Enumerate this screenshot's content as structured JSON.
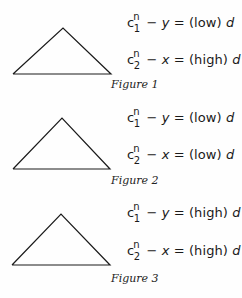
{
  "figures": [
    {
      "caption": "Figure 1",
      "eq1": {
        "c": "c",
        "sup": "n",
        "sub": "1",
        "minus": "−",
        "var": "y",
        "eq": "=",
        "level": "(low)",
        "d": "d"
      },
      "eq2": {
        "c": "c",
        "sup": "n",
        "sub": "2",
        "minus": "−",
        "var": "x",
        "eq": "=",
        "level": "(high)",
        "d": "d"
      }
    },
    {
      "caption": "Figure 2",
      "eq1": {
        "c": "c",
        "sup": "n",
        "sub": "1",
        "minus": "−",
        "var": "y",
        "eq": "=",
        "level": "(low)",
        "d": "d"
      },
      "eq2": {
        "c": "c",
        "sup": "n",
        "sub": "2",
        "minus": "−",
        "var": "x",
        "eq": "=",
        "level": "(low)",
        "d": "d"
      }
    },
    {
      "caption": "Figure 3",
      "eq1": {
        "c": "c",
        "sup": "n",
        "sub": "1",
        "minus": "−",
        "var": "y",
        "eq": "=",
        "level": "(high)",
        "d": "d"
      },
      "eq2": {
        "c": "c",
        "sup": "n",
        "sub": "2",
        "minus": "−",
        "var": "x",
        "eq": "=",
        "level": "(high)",
        "d": "d"
      }
    }
  ]
}
